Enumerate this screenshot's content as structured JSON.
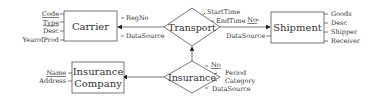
{
  "diagram": {
    "type": "er-diagram",
    "entities": [
      {
        "id": "carrier",
        "name": "Carrier",
        "attributes": [
          {
            "name": "Code",
            "key": true
          },
          {
            "name": "Type",
            "key": true
          },
          {
            "name": "Desc",
            "key": false
          },
          {
            "name": "YearofProd",
            "key": false
          }
        ]
      },
      {
        "id": "shipment",
        "name": "Shipment",
        "attributes": [
          {
            "name": "Goods",
            "key": false
          },
          {
            "name": "Desc",
            "key": false
          },
          {
            "name": "Shipper",
            "key": false
          },
          {
            "name": "Receiver",
            "key": false
          }
        ]
      },
      {
        "id": "insurance_company",
        "name_line1": "Insurance",
        "name_line2": "Company",
        "attributes": [
          {
            "name": "Name",
            "key": true
          },
          {
            "name": "Address",
            "key": false
          }
        ]
      }
    ],
    "relationships": [
      {
        "id": "transport",
        "name": "Transport",
        "attr_left": [
          {
            "name": "RegNo",
            "key": false
          },
          {
            "name": "DataSource",
            "key": false
          }
        ],
        "attr_right": [
          {
            "name": "StartTime",
            "key": false
          },
          {
            "name": "EndTime",
            "key": false
          },
          {
            "name": "No",
            "key": true
          },
          {
            "name": "DataSource",
            "key": false
          }
        ]
      },
      {
        "id": "insurance",
        "name": "Insurance",
        "attributes": [
          {
            "name": "No",
            "key": true
          },
          {
            "name": "Period",
            "key": false
          },
          {
            "name": "Category",
            "key": false
          },
          {
            "name": "DataSource",
            "key": false
          }
        ]
      }
    ],
    "edges": [
      {
        "from": "transport",
        "to": "carrier",
        "arrow": true
      },
      {
        "from": "transport",
        "to": "shipment",
        "arrow": true
      },
      {
        "from": "insurance",
        "to": "transport",
        "arrow": true
      },
      {
        "from": "insurance",
        "to": "insurance_company",
        "arrow": true
      }
    ]
  }
}
